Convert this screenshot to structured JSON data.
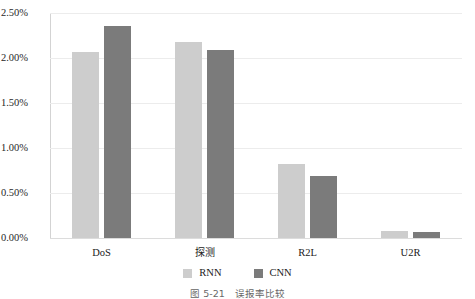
{
  "chart_data": {
    "type": "bar",
    "title": "",
    "subtitle": "",
    "xlabel": "",
    "ylabel": "",
    "categories": [
      "DoS",
      "探测",
      "R2L",
      "U2R"
    ],
    "series": [
      {
        "name": "RNN",
        "color": "#cdcdcd",
        "values": [
          2.07,
          2.18,
          0.82,
          0.08
        ]
      },
      {
        "name": "CNN",
        "color": "#7b7b7b",
        "values": [
          2.36,
          2.09,
          0.69,
          0.07
        ]
      }
    ],
    "ylim": [
      0.0,
      2.5
    ],
    "ytick_values": [
      2.5,
      2.0,
      1.5,
      1.0,
      0.5,
      0.0
    ],
    "ytick_labels": [
      "2.50%",
      "2.00%",
      "1.50%",
      "1.00%",
      "0.50%",
      "0.00%"
    ],
    "value_unit": "%",
    "grid": true,
    "grid_axis": "y",
    "legend_position": "bottom",
    "legend_entries": [
      "RNN",
      "CNN"
    ]
  },
  "legend": {
    "entries": [
      {
        "label": "RNN",
        "swatch": "rnn"
      },
      {
        "label": "CNN",
        "swatch": "cnn"
      }
    ]
  },
  "caption": {
    "number": "图 5-21",
    "text": "误报率比较"
  }
}
